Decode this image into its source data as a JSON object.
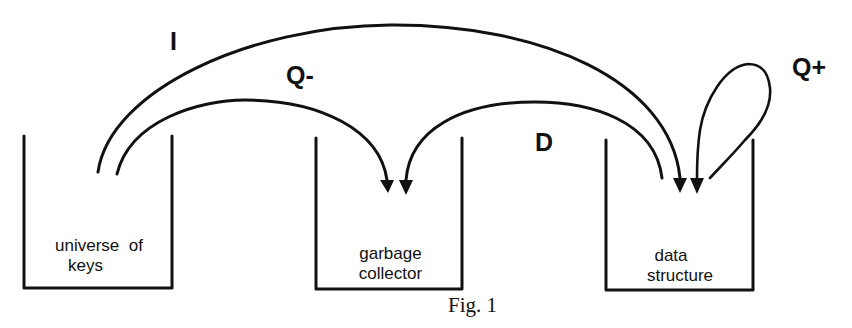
{
  "figure": {
    "caption": "Fig. 1",
    "colors": {
      "ink": "#111111",
      "background": "#ffffff"
    },
    "containers": [
      {
        "id": "universe",
        "label_line1": "universe  of",
        "label_line2": "keys"
      },
      {
        "id": "garbage",
        "label_line1": "garbage",
        "label_line2": "collector"
      },
      {
        "id": "data",
        "label_line1": "data",
        "label_line2": "structure"
      }
    ],
    "operations": [
      {
        "label": "I",
        "from": "universe of keys",
        "to": "data structure"
      },
      {
        "label": "Q-",
        "from": "universe of keys",
        "to": "garbage collector"
      },
      {
        "label": "D",
        "from": "data structure",
        "to": "garbage collector"
      },
      {
        "label": "Q+",
        "from": "data structure",
        "to": "data structure"
      }
    ]
  }
}
